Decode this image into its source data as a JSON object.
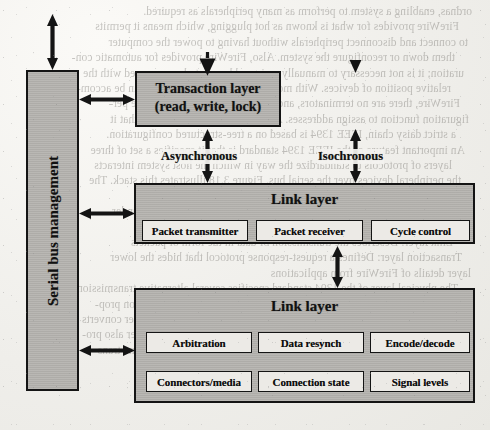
{
  "diagram": {
    "accent_fill": "#b6b4b0",
    "subbox_fill": "#eceae6",
    "line_color": "#141414",
    "paper_color": "#f2f1ee"
  },
  "serial_bus": {
    "label": "Serial bus management"
  },
  "transaction": {
    "line1": "Transaction layer",
    "line2": "(read, write, lock)"
  },
  "link": {
    "title": "Link layer",
    "items": [
      {
        "label": "Packet transmitter"
      },
      {
        "label": "Packet receiver"
      },
      {
        "label": "Cycle control"
      }
    ]
  },
  "physical": {
    "title": "Link layer",
    "items_row1": [
      {
        "label": "Arbitration"
      },
      {
        "label": "Data resynch"
      },
      {
        "label": "Encode/decode"
      }
    ],
    "items_row2": [
      {
        "label": "Connectors/media"
      },
      {
        "label": "Connection state"
      },
      {
        "label": "Signal levels"
      }
    ]
  },
  "connectors": {
    "asynchronous": "Asynchronous",
    "isochronous": "Isochronous"
  },
  "bleed_text": {
    "lines": [
      "ordnas, enabling a system to perform as many peripherals as required.",
      "FireWire provides for what is known as hot plugging, which means it permits",
      "to connect and disconnect peripherals without having to power the computer",
      "them down or reconfigure the system.  Also, FireWire provides for automatic con-",
      "uration; it is not necessary to manually assign addresses to be concerned with the",
      "relative position of devices.  With more than 63 devices FireWire can be accom-",
      "FireWire, there are no terminators, and the system does not need to be per-",
      "figuration function to assign addresses.  Another feature of FireWire is that it",
      "a strict daisy chain, IEEE 1394 is based on a tree-structured configuration.",
      "An important feature of the IEEE 1394 standard is that it specifies a set of three",
      "layers of protocols to standardize the way in which the host system interacts",
      "the peripheral devices over the serial bus.  Figure 3.18 illustrates this stack.  The",
      "three layers of the stack are as follows:",
      "Physical layer: Defines the transmission media that are permissible under",
      "FireWire and the electrical and signaling characteristics of each",
      "Link layer: Describes the transmission of data in the form of packets",
      "Transaction layer: Defines a request-response protocol that hides the lower",
      "layer details of FireWire from applications",
      "The physical layer of the 1394 standard specifies several alternative transmission",
      "media and their connectors, with different physical and data transmission prop-",
      "erties.  Data rates from 25 to 400 Mbps are defined.  The physical layer converts",
      "binary data into electrical signals for various physical media.  This layer also pro-",
      "vides the initial arbitration service, ensuring that only one device at a time trans-"
    ]
  }
}
